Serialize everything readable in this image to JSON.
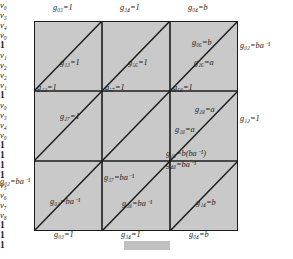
{
  "figure": {
    "type": "torus-triangulation-grid",
    "rows": 3,
    "cols": 3,
    "fill_color": "#c9c9c9",
    "line_color": "#1c1c1c",
    "caption": ""
  },
  "top_edge": [
    {
      "name": "g03",
      "text": "g₀₃=1"
    },
    {
      "name": "g34",
      "text": "g₃₄=1"
    },
    {
      "name": "g04",
      "text": "g₀₄=b"
    }
  ],
  "bottom_edge": [
    {
      "name": "g03",
      "text": "g₀₃=1"
    },
    {
      "name": "g34",
      "text": "g₃₄=1"
    },
    {
      "name": "g04",
      "text": "g₀₄=b"
    }
  ],
  "top_vertices": [
    {
      "name": "v0",
      "text": "v₀"
    },
    {
      "name": "v3",
      "text": "v₃"
    },
    {
      "name": "v4",
      "text": "v₄"
    },
    {
      "name": "v0r",
      "text": "v₀"
    }
  ],
  "bottom_vertices": [
    {
      "name": "v0",
      "text": "v₀"
    },
    {
      "name": "v3",
      "text": "v₃"
    },
    {
      "name": "v4",
      "text": "v₄"
    },
    {
      "name": "v0r",
      "text": "v₀"
    }
  ],
  "left_vertices": [
    {
      "name": "v0",
      "text": "v₀"
    },
    {
      "name": "v1",
      "text": "v₁"
    },
    {
      "name": "v2",
      "text": "v₂"
    }
  ],
  "right_vertices": [
    {
      "name": "v0",
      "text": "v₀"
    },
    {
      "name": "v2",
      "text": "v₂"
    },
    {
      "name": "v1",
      "text": "v₁"
    }
  ],
  "left_edge": [
    {
      "name": "g01",
      "text": "1"
    },
    {
      "name": "g02",
      "text": "g₀₂=ba⁻¹"
    }
  ],
  "right_edge": [
    {
      "name": "g02",
      "text": "g₀₂=ba⁻¹"
    },
    {
      "name": "g12",
      "text": "g₁₂=1"
    },
    {
      "name": "g01",
      "text": "1"
    }
  ],
  "interior": {
    "row1": [
      {
        "name": "g01-triangle-label",
        "text": "1"
      },
      {
        "name": "g13",
        "text": "g₁₃=1"
      },
      {
        "name": "tri-1a",
        "text": "1"
      },
      {
        "name": "tri-1b",
        "text": "1"
      },
      {
        "name": "g56",
        "text": "g₅₆=1"
      },
      {
        "name": "tri-1c",
        "text": "1"
      },
      {
        "name": "g06",
        "text": "g₀₆=b"
      },
      {
        "name": "g26",
        "text": "g₂₆=a"
      }
    ],
    "row2": [
      {
        "name": "g12",
        "text": "g₁₂=1"
      },
      {
        "name": "tri-2a",
        "text": "1"
      },
      {
        "name": "g27",
        "text": "g₂₇=1"
      },
      {
        "name": "g57",
        "text": "g₅₇=1"
      },
      {
        "name": "tri-2b",
        "text": "1"
      },
      {
        "name": "tri-2c",
        "text": "1"
      },
      {
        "name": "g68",
        "text": "g₆₈=1"
      },
      {
        "name": "g28",
        "text": "g₂₈=a"
      },
      {
        "name": "g18",
        "text": "g₁₈=a"
      }
    ],
    "row3": [
      {
        "name": "g02-tri",
        "text": "g₀₂=ba⁻¹"
      },
      {
        "name": "g37",
        "text": "g₃₇=ba⁻¹"
      },
      {
        "name": "g38",
        "text": "g₃₈=ba⁻¹"
      },
      {
        "name": "g18b",
        "text": "g₁₈=b(ba⁻¹)"
      },
      {
        "name": "g48",
        "text": "g₄₈=ba⁻¹"
      },
      {
        "name": "g14",
        "text": "g₁₄=b"
      }
    ]
  },
  "middle_vertices": [
    {
      "name": "v5",
      "text": "v₅"
    },
    {
      "name": "v6",
      "text": "v₆"
    },
    {
      "name": "v7",
      "text": "v₇"
    },
    {
      "name": "v8",
      "text": "v₈"
    }
  ]
}
